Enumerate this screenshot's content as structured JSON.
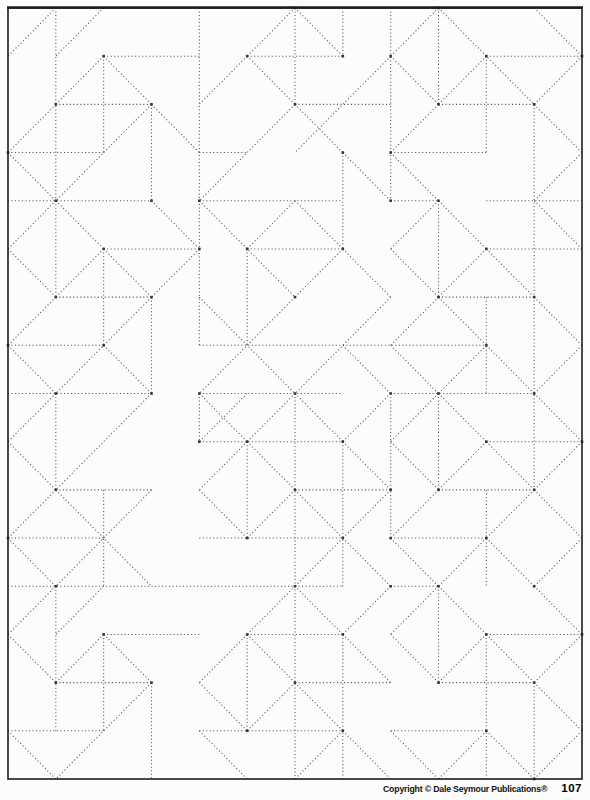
{
  "footer": {
    "copyright": "Copyright © Dale Seymour Publications®",
    "page_number": "107"
  },
  "pattern": {
    "description": "dotted-line geometric quilt tessellation on square grid",
    "grid": {
      "cols": 12,
      "rows": 16,
      "left": 8,
      "top": 8,
      "right": 582,
      "bottom": 779
    },
    "style": {
      "dot_color": "#4f4f4f",
      "node_color": "#383838",
      "border_color": "#1c1c1c",
      "paper_color": "#fcfcfb",
      "dot_size": 1.05,
      "dot_gap": 2.45,
      "node_size": 2.6,
      "border_width": 1.6,
      "top_border_width": 2.6
    },
    "segments": {
      "v": [
        [
          1,
          0,
          4
        ],
        [
          2,
          1,
          3
        ],
        [
          3,
          2,
          4
        ],
        [
          4,
          0,
          7
        ],
        [
          4,
          8,
          9
        ],
        [
          6,
          0,
          2
        ],
        [
          7,
          0,
          1
        ],
        [
          7,
          3,
          5
        ],
        [
          8,
          0,
          4
        ],
        [
          9,
          0,
          2
        ],
        [
          10,
          1,
          3
        ],
        [
          11,
          2,
          10
        ],
        [
          1,
          4,
          6
        ],
        [
          2,
          5,
          7
        ],
        [
          3,
          6,
          8
        ],
        [
          5,
          5,
          7
        ],
        [
          9,
          4,
          6
        ],
        [
          10,
          6,
          8
        ],
        [
          8,
          8,
          11
        ],
        [
          1,
          8,
          10
        ],
        [
          2,
          10,
          12
        ],
        [
          5,
          9,
          11
        ],
        [
          6,
          8,
          16
        ],
        [
          7,
          9,
          12
        ],
        [
          9,
          8,
          10
        ],
        [
          9,
          12,
          14
        ],
        [
          10,
          10,
          12
        ],
        [
          1,
          12,
          15
        ],
        [
          2,
          13,
          15
        ],
        [
          3,
          14,
          16
        ],
        [
          5,
          13,
          15
        ],
        [
          7,
          13,
          16
        ],
        [
          10,
          13,
          16
        ],
        [
          11,
          14,
          16
        ]
      ],
      "h": [
        [
          1,
          2,
          4
        ],
        [
          1,
          5,
          7
        ],
        [
          1,
          10,
          12
        ],
        [
          2,
          1,
          3
        ],
        [
          2,
          6,
          8
        ],
        [
          2,
          9,
          11
        ],
        [
          3,
          0,
          2
        ],
        [
          3,
          4,
          5
        ],
        [
          3,
          8,
          10
        ],
        [
          4,
          0,
          3
        ],
        [
          4,
          4,
          7
        ],
        [
          4,
          8,
          9
        ],
        [
          4,
          10,
          12
        ],
        [
          5,
          2,
          4
        ],
        [
          5,
          5,
          7
        ],
        [
          5,
          10,
          12
        ],
        [
          6,
          1,
          3
        ],
        [
          6,
          9,
          11
        ],
        [
          7,
          0,
          2
        ],
        [
          7,
          4,
          10
        ],
        [
          8,
          0,
          3
        ],
        [
          8,
          4,
          7
        ],
        [
          8,
          8,
          11
        ],
        [
          9,
          4,
          7
        ],
        [
          9,
          10,
          12
        ],
        [
          10,
          1,
          3
        ],
        [
          10,
          6,
          8
        ],
        [
          10,
          9,
          11
        ],
        [
          11,
          0,
          2
        ],
        [
          11,
          4,
          7
        ],
        [
          11,
          8,
          10
        ],
        [
          12,
          0,
          7
        ],
        [
          12,
          8,
          9
        ],
        [
          13,
          2,
          4
        ],
        [
          13,
          5,
          7
        ],
        [
          13,
          10,
          12
        ],
        [
          14,
          1,
          3
        ],
        [
          14,
          6,
          8
        ],
        [
          14,
          9,
          11
        ],
        [
          15,
          0,
          2
        ],
        [
          15,
          4,
          7
        ],
        [
          15,
          8,
          10
        ]
      ],
      "d": [
        [
          1,
          0,
          0,
          1
        ],
        [
          2,
          0,
          1,
          1
        ],
        [
          2,
          1,
          1,
          2
        ],
        [
          2,
          1,
          3,
          2
        ],
        [
          3,
          2,
          4,
          3
        ],
        [
          3,
          2,
          1,
          4
        ],
        [
          1,
          2,
          0,
          3
        ],
        [
          0,
          3,
          1,
          4
        ],
        [
          6,
          0,
          5,
          1
        ],
        [
          6,
          0,
          7,
          1
        ],
        [
          5,
          1,
          4,
          2
        ],
        [
          5,
          1,
          6,
          2
        ],
        [
          6,
          2,
          4,
          4
        ],
        [
          6,
          2,
          7,
          3
        ],
        [
          8,
          1,
          6,
          3
        ],
        [
          7,
          3,
          8,
          4
        ],
        [
          9,
          0,
          8,
          1
        ],
        [
          8,
          1,
          9,
          2
        ],
        [
          9,
          0,
          11,
          2
        ],
        [
          10,
          1,
          9,
          2
        ],
        [
          11,
          0,
          12,
          1
        ],
        [
          12,
          1,
          11,
          2
        ],
        [
          11,
          2,
          12,
          3
        ],
        [
          9,
          2,
          8,
          3
        ],
        [
          8,
          3,
          9,
          4
        ],
        [
          12,
          3,
          11,
          4
        ],
        [
          1,
          4,
          0,
          5
        ],
        [
          0,
          5,
          1,
          6
        ],
        [
          1,
          4,
          2,
          5
        ],
        [
          2,
          5,
          1,
          6
        ],
        [
          2,
          5,
          3,
          6
        ],
        [
          3,
          4,
          4,
          5
        ],
        [
          4,
          5,
          3,
          6
        ],
        [
          3,
          6,
          1,
          8
        ],
        [
          2,
          7,
          3,
          8
        ],
        [
          1,
          6,
          0,
          7
        ],
        [
          0,
          7,
          1,
          8
        ],
        [
          4,
          4,
          6,
          6
        ],
        [
          6,
          4,
          5,
          5
        ],
        [
          6,
          4,
          7,
          5
        ],
        [
          7,
          5,
          6,
          6
        ],
        [
          7,
          5,
          8,
          6
        ],
        [
          4,
          6,
          6,
          8
        ],
        [
          6,
          6,
          4,
          8
        ],
        [
          8,
          6,
          6,
          8
        ],
        [
          7,
          7,
          8,
          8
        ],
        [
          9,
          4,
          8,
          5
        ],
        [
          8,
          5,
          9,
          6
        ],
        [
          9,
          4,
          10,
          5
        ],
        [
          10,
          5,
          9,
          6
        ],
        [
          10,
          5,
          11,
          6
        ],
        [
          11,
          4,
          12,
          5
        ],
        [
          9,
          6,
          8,
          7
        ],
        [
          9,
          6,
          10,
          7
        ],
        [
          8,
          7,
          9,
          8
        ],
        [
          10,
          7,
          9,
          8
        ],
        [
          10,
          7,
          11,
          8
        ],
        [
          11,
          6,
          12,
          7
        ],
        [
          12,
          7,
          11,
          8
        ],
        [
          1,
          8,
          0,
          9
        ],
        [
          0,
          9,
          1,
          10
        ],
        [
          3,
          8,
          1,
          10
        ],
        [
          1,
          10,
          3,
          12
        ],
        [
          3,
          10,
          1,
          12
        ],
        [
          1,
          10,
          0,
          11
        ],
        [
          0,
          11,
          1,
          12
        ],
        [
          4,
          8,
          5,
          9
        ],
        [
          5,
          8,
          4,
          9
        ],
        [
          6,
          8,
          5,
          9
        ],
        [
          6,
          8,
          7,
          9
        ],
        [
          5,
          9,
          4,
          10
        ],
        [
          4,
          10,
          5,
          11
        ],
        [
          5,
          9,
          6,
          10
        ],
        [
          6,
          10,
          5,
          11
        ],
        [
          6,
          10,
          7,
          11
        ],
        [
          8,
          8,
          7,
          9
        ],
        [
          7,
          9,
          8,
          10
        ],
        [
          8,
          10,
          7,
          11
        ],
        [
          7,
          11,
          6,
          12
        ],
        [
          7,
          11,
          8,
          12
        ],
        [
          9,
          8,
          8,
          9
        ],
        [
          8,
          9,
          9,
          10
        ],
        [
          9,
          8,
          10,
          9
        ],
        [
          10,
          9,
          9,
          10
        ],
        [
          10,
          9,
          11,
          10
        ],
        [
          11,
          8,
          12,
          9
        ],
        [
          12,
          9,
          11,
          10
        ],
        [
          11,
          10,
          10,
          11
        ],
        [
          11,
          10,
          12,
          11
        ],
        [
          9,
          10,
          8,
          11
        ],
        [
          10,
          11,
          9,
          12
        ],
        [
          10,
          11,
          11,
          12
        ],
        [
          8,
          11,
          9,
          12
        ],
        [
          12,
          11,
          11,
          12
        ],
        [
          1,
          12,
          0,
          13
        ],
        [
          2,
          12,
          1,
          13
        ],
        [
          0,
          13,
          1,
          14
        ],
        [
          2,
          13,
          1,
          14
        ],
        [
          2,
          13,
          3,
          14
        ],
        [
          3,
          14,
          1,
          16
        ],
        [
          0,
          15,
          1,
          16
        ],
        [
          6,
          12,
          5,
          13
        ],
        [
          6,
          12,
          7,
          13
        ],
        [
          5,
          13,
          4,
          14
        ],
        [
          4,
          14,
          5,
          15
        ],
        [
          5,
          13,
          6,
          14
        ],
        [
          6,
          14,
          5,
          15
        ],
        [
          6,
          14,
          7,
          15
        ],
        [
          8,
          12,
          7,
          13
        ],
        [
          7,
          13,
          8,
          14
        ],
        [
          7,
          15,
          8,
          16
        ],
        [
          7,
          15,
          6,
          16
        ],
        [
          4,
          15,
          5,
          16
        ],
        [
          9,
          12,
          8,
          13
        ],
        [
          8,
          13,
          9,
          14
        ],
        [
          9,
          12,
          10,
          13
        ],
        [
          10,
          13,
          9,
          14
        ],
        [
          10,
          13,
          11,
          14
        ],
        [
          11,
          12,
          12,
          13
        ],
        [
          12,
          13,
          11,
          14
        ],
        [
          11,
          14,
          12,
          15
        ],
        [
          10,
          15,
          9,
          16
        ],
        [
          10,
          15,
          11,
          16
        ],
        [
          8,
          15,
          9,
          16
        ],
        [
          12,
          15,
          11,
          16
        ]
      ]
    }
  }
}
